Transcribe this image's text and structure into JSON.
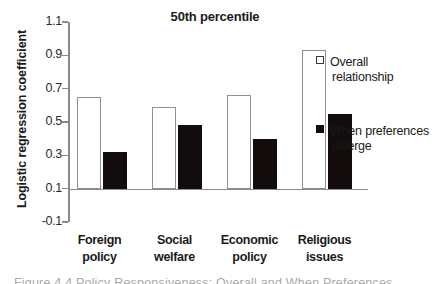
{
  "chart_data": {
    "type": "bar",
    "title": "50th percentile",
    "xlabel": "",
    "ylabel": "Logistic regression coefficient",
    "ylim": [
      -0.1,
      1.1
    ],
    "yticks": [
      "1.1",
      "0.9",
      "0.7",
      "0.5",
      "0.3",
      "0.1",
      "-0.1"
    ],
    "ytick_values": [
      1.1,
      0.9,
      0.7,
      0.5,
      0.3,
      0.1,
      -0.1
    ],
    "grid": false,
    "legend_position": "right",
    "categories": [
      "Foreign policy",
      "Social welfare",
      "Economic policy",
      "Religious issues"
    ],
    "category_lines": [
      [
        "Foreign",
        "policy"
      ],
      [
        "Social",
        "welfare"
      ],
      [
        "Economic",
        "policy"
      ],
      [
        "Religious",
        "issues"
      ]
    ],
    "series": [
      {
        "name": "Overall relationship",
        "style": "open",
        "color": "#ffffff",
        "edge_color": "#8f8f8f",
        "values": [
          0.55,
          0.49,
          0.56,
          0.83
        ]
      },
      {
        "name": "When preferences diverge",
        "style": "filled",
        "color": "#120d0c",
        "edge_color": "#120d0c",
        "values": [
          0.22,
          0.38,
          0.3,
          0.45
        ]
      }
    ]
  },
  "legend": {
    "items": [
      {
        "line1": "Overall",
        "line2": "relationship",
        "swatch": "open"
      },
      {
        "line1": "When preferences",
        "line2": "diverge",
        "swatch": "filled"
      }
    ]
  },
  "caption": {
    "sliver_text": "Figure 4.4  Policy Responsiveness: Overall and When Preferences"
  }
}
